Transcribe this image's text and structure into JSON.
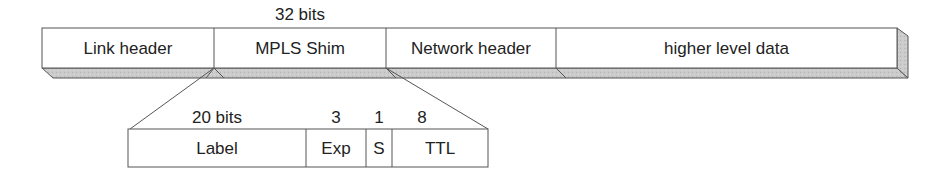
{
  "top_width_label": "32 bits",
  "packet": {
    "fields": [
      {
        "label": "Link header"
      },
      {
        "label": "MPLS Shim"
      },
      {
        "label": "Network header"
      },
      {
        "label": "higher level data"
      }
    ]
  },
  "shim": {
    "bit_labels": [
      "20 bits",
      "3",
      "1",
      "8"
    ],
    "fields": [
      {
        "label": "Label"
      },
      {
        "label": "Exp"
      },
      {
        "label": "S"
      },
      {
        "label": "TTL"
      }
    ]
  },
  "colors": {
    "stroke": "#555555",
    "shadow": "#c8c8c8",
    "face": "#ffffff"
  }
}
